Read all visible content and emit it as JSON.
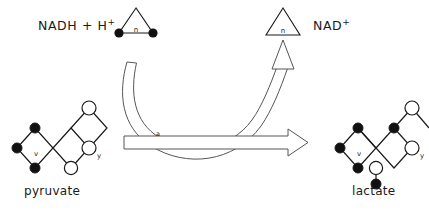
{
  "diagram": {
    "cofactors": {
      "reduced": {
        "label": "NADH + H",
        "charge": "+",
        "glyph_letter": "n",
        "glyph_name": "triangle-with-two-filled-vertices"
      },
      "oxidized": {
        "label": "NAD",
        "charge": "+",
        "glyph_letter": "n",
        "glyph_name": "plain-triangle"
      }
    },
    "substrate": {
      "name": "pyruvate",
      "atom_labels": [
        "v",
        "y"
      ]
    },
    "product": {
      "name": "lactate",
      "atom_labels": [
        "v",
        "y"
      ]
    },
    "reaction_arrow": {
      "name": "horizontal-outline-arrow",
      "label": "a",
      "direction": "right"
    },
    "cofactor_arrow": {
      "name": "curved-outline-arrow",
      "direction": "up-right"
    },
    "colors": {
      "stroke": "#1a1a1a",
      "fill_filled_atom": "#111111",
      "fill_open_atom": "#ffffff",
      "background": "#ffffff",
      "arrow_outline": "#555555"
    }
  }
}
